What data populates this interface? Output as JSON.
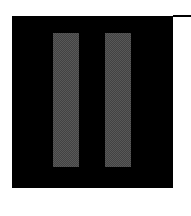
{
  "control": {
    "icon": "pause-icon",
    "label": "Pause",
    "background_color": "#000000",
    "bar_color": "#585858"
  }
}
